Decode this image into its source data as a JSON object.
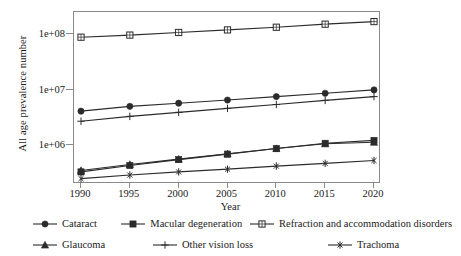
{
  "chart_data": {
    "type": "line",
    "title": "",
    "xlabel": "Year",
    "ylabel": "All age prevalence number",
    "yscale": "log",
    "ylim": [
      200000,
      250000000
    ],
    "grid": false,
    "legend_position": "bottom",
    "x": [
      1990,
      1995,
      2000,
      2005,
      2010,
      2015,
      2020
    ],
    "xtick_labels": [
      "1990",
      "1995",
      "2000",
      "2005",
      "2010",
      "2015",
      "2020"
    ],
    "ytick_labels": [
      "1e+08",
      "1e+07",
      "1e+06"
    ],
    "ytick_values": [
      100000000,
      10000000,
      1000000
    ],
    "series": [
      {
        "name": "Cataract",
        "marker": "filled-circle",
        "values": [
          4100000,
          5000000,
          5700000,
          6500000,
          7500000,
          8600000,
          9900000
        ]
      },
      {
        "name": "Macular degeneration",
        "marker": "filled-square",
        "values": [
          330000,
          430000,
          550000,
          690000,
          870000,
          1080000,
          1220000
        ]
      },
      {
        "name": "Refraction and accommodation disorders",
        "marker": "open-square",
        "values": [
          88000000,
          96000000,
          107000000,
          119000000,
          133000000,
          151000000,
          168000000
        ]
      },
      {
        "name": "Glaucoma",
        "marker": "filled-triangle",
        "values": [
          350000,
          450000,
          560000,
          700000,
          870000,
          1060000,
          1130000
        ]
      },
      {
        "name": "Other vision loss",
        "marker": "plus",
        "values": [
          2700000,
          3300000,
          3900000,
          4600000,
          5400000,
          6400000,
          7500000
        ]
      },
      {
        "name": "Trachoma",
        "marker": "asterisk",
        "values": [
          250000,
          290000,
          330000,
          370000,
          420000,
          470000,
          530000
        ]
      }
    ]
  },
  "colors": {
    "line": "#2b2b2b",
    "frame": "#8a8a8a",
    "text": "#1a1a1a"
  }
}
